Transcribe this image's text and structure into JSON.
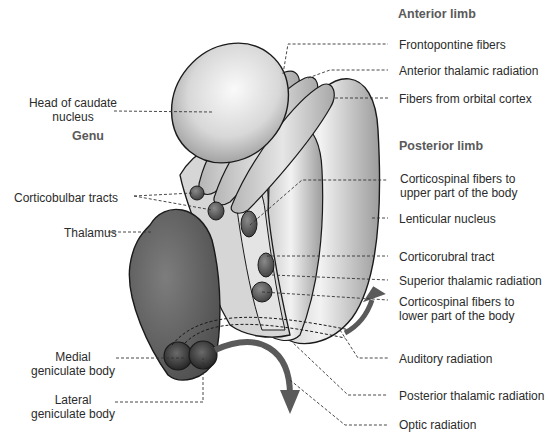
{
  "diagram": {
    "headings": {
      "anterior_limb": "Anterior limb",
      "posterior_limb": "Posterior limb",
      "genu": "Genu"
    },
    "labels_left": {
      "head_caudate_1": "Head of caudate",
      "head_caudate_2": "nucleus",
      "corticobulbar": "Corticobulbar tracts",
      "thalamus": "Thalamus",
      "medial_gen_1": "Medial",
      "medial_gen_2": "geniculate body",
      "lateral_gen_1": "Lateral",
      "lateral_gen_2": "geniculate body"
    },
    "labels_right": {
      "frontopontine": "Frontopontine fibers",
      "anterior_thalamic": "Anterior thalamic radiation",
      "orbital_cortex": "Fibers from orbital cortex",
      "corticospinal_upper_1": "Corticospinal fibers to",
      "corticospinal_upper_2": "upper part of the body",
      "lenticular": "Lenticular nucleus",
      "corticorubral": "Corticorubral tract",
      "superior_thalamic": "Superior thalamic radiation",
      "corticospinal_lower_1": "Corticospinal fibers to",
      "corticospinal_lower_2": "lower part of the body",
      "auditory": "Auditory radiation",
      "posterior_thalamic": "Posterior thalamic radiation",
      "optic": "Optic radiation"
    },
    "colors": {
      "outline": "#1a1a1a",
      "thalamus": "#6e6e6e",
      "light_structure": "#d9d9d9",
      "tract_dots": "#555555",
      "arrow": "#5a5a5a",
      "heading_text": "#5a5a5a",
      "label_text": "#2b2b2b"
    }
  }
}
